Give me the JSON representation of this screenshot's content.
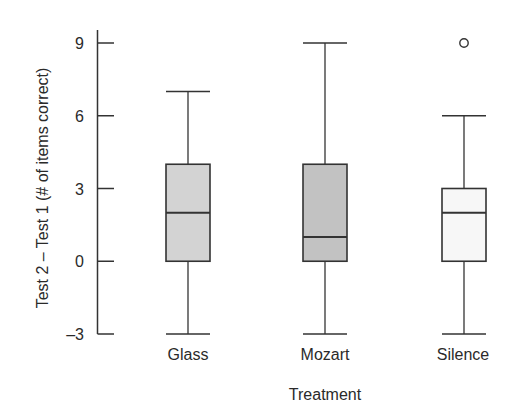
{
  "chart_data": {
    "type": "box",
    "title": "",
    "xlabel": "Treatment",
    "ylabel": "Test 2 – Test 1 (# of items correct)",
    "ylim": [
      -3,
      9
    ],
    "yticks": [
      -3,
      0,
      3,
      6,
      9
    ],
    "ytick_labels": [
      "–3",
      "0",
      "3",
      "6",
      "9"
    ],
    "grid": false,
    "legend": null,
    "categories": [
      "Glass",
      "Mozart",
      "Silence"
    ],
    "series": [
      {
        "name": "Glass",
        "whisker_low": -3,
        "q1": 0,
        "median": 2,
        "q3": 4,
        "whisker_high": 7,
        "outliers": [],
        "fill": "#d3d3d3"
      },
      {
        "name": "Mozart",
        "whisker_low": -3,
        "q1": 0,
        "median": 1,
        "q3": 4,
        "whisker_high": 9,
        "outliers": [],
        "fill": "#c2c2c2"
      },
      {
        "name": "Silence",
        "whisker_low": -3,
        "q1": 0,
        "median": 2,
        "q3": 3,
        "whisker_high": 6,
        "outliers": [
          9
        ],
        "fill": "#f7f7f7"
      }
    ]
  },
  "axes": {
    "y_title": "Test 2 – Test 1 (# of items correct)",
    "x_title": "Treatment",
    "y_tick_labels": [
      "9",
      "6",
      "3",
      "0",
      "–3"
    ],
    "x_category_labels": [
      "Glass",
      "Mozart",
      "Silence"
    ]
  },
  "colors": {
    "stroke": "#333333",
    "text": "#2a2a2a"
  }
}
